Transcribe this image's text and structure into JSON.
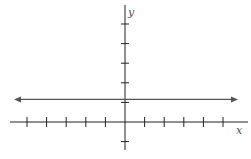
{
  "chart_data": {
    "type": "line",
    "title": "",
    "xlabel": "x",
    "ylabel": "y",
    "xlim": [
      -5,
      5
    ],
    "ylim": [
      -1,
      5
    ],
    "grid": false,
    "x_ticks": [
      -5,
      -4,
      -3,
      -2,
      -1,
      1,
      2,
      3,
      4,
      5
    ],
    "y_ticks": [
      -1,
      1,
      2,
      3,
      4,
      5
    ],
    "tick_labels_shown": false,
    "series": [
      {
        "name": "y = 1",
        "equation": "y = 1",
        "x": [
          -6,
          6
        ],
        "values": [
          1,
          1
        ],
        "arrows_both_ends": true
      }
    ]
  },
  "colors": {
    "axis": "#222222",
    "line": "#555555"
  }
}
